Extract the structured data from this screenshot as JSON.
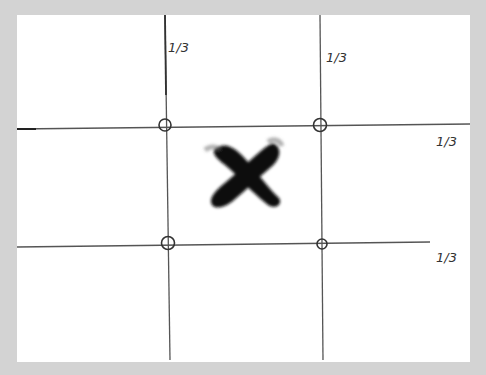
{
  "diagram": {
    "background_color": "#d3d3d3",
    "paper": {
      "x": 17,
      "y": 15,
      "width": 453,
      "height": 347,
      "color": "#ffffff"
    },
    "line_color": "#555555",
    "vertical_lines": [
      {
        "x1": 165,
        "y1": 15,
        "x2": 170,
        "y2": 360,
        "label": "1/3",
        "label_x": 168,
        "label_y": 52
      },
      {
        "x1": 320,
        "y1": 15,
        "x2": 323,
        "y2": 360,
        "label": "1/3",
        "label_x": 326,
        "label_y": 62
      }
    ],
    "horizontal_lines": [
      {
        "x1": 17,
        "y1": 129,
        "x2": 470,
        "y2": 124,
        "label": "1/3",
        "label_x": 436,
        "label_y": 146
      },
      {
        "x1": 17,
        "y1": 247,
        "x2": 430,
        "y2": 242,
        "label": "1/3",
        "label_x": 436,
        "label_y": 262
      }
    ],
    "intersections": [
      {
        "cx": 165,
        "cy": 125,
        "r": 6
      },
      {
        "cx": 320,
        "cy": 125,
        "r": 6.5
      },
      {
        "cx": 168,
        "cy": 243,
        "r": 6.5
      },
      {
        "cx": 322,
        "cy": 244,
        "r": 5
      }
    ],
    "subject_mark": {
      "shape": "X",
      "color": "#111111",
      "center_x": 246,
      "center_y": 175,
      "annotation": "subject placed at center (not on thirds)"
    }
  }
}
